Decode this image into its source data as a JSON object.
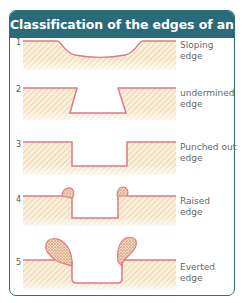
{
  "title": "Classification of the edges of an ulcer",
  "colors": {
    "header_bg": "#2b6a78",
    "border": "#2f6f7c",
    "edge_line": "#e07a86",
    "tissue_fill": "#fbefd9",
    "hatch": "#d9b98f",
    "granulation_dots": "#8a4a3a"
  },
  "rows": [
    {
      "number": "1",
      "label_line1": "Sloping",
      "label_line2": "edge"
    },
    {
      "number": "2",
      "label_line1": "undermined",
      "label_line2": "edge"
    },
    {
      "number": "3",
      "label_line1": "Punched out",
      "label_line2": "edge"
    },
    {
      "number": "4",
      "label_line1": "Raised",
      "label_line2": "edge"
    },
    {
      "number": "5",
      "label_line1": "Everted",
      "label_line2": "edge"
    }
  ]
}
